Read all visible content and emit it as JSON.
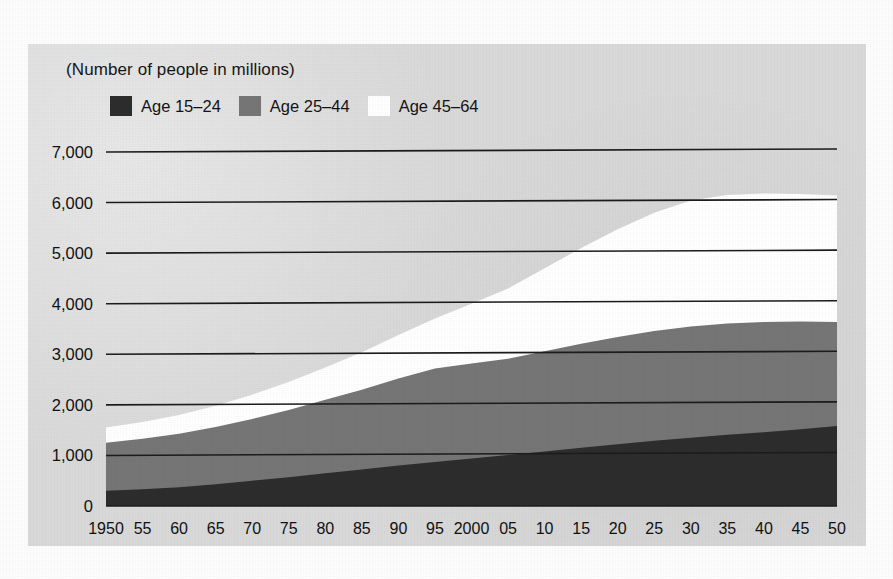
{
  "figure": {
    "units_label": "(Number of people in millions)"
  },
  "legend": {
    "items": [
      {
        "label": "Age 15–24",
        "color": "#2d2d2d"
      },
      {
        "label": "Age 25–44",
        "color": "#767676"
      },
      {
        "label": "Age 45–64",
        "color": "#ffffff"
      }
    ]
  },
  "colors": {
    "panel_background": "#d9d9d9",
    "age_15_24": "#2d2d2d",
    "age_25_44": "#767676",
    "age_45_64": "#ffffff",
    "axis": "#1c1c1c",
    "text": "#121212"
  },
  "chart_data": {
    "type": "area",
    "stacked": true,
    "title": "",
    "subtitle": "",
    "xlabel": "",
    "ylabel": "",
    "units": "(Number of people in millions)",
    "grid": true,
    "legend_position": "top-left",
    "xlim": [
      1950,
      2050
    ],
    "ylim": [
      0,
      7000
    ],
    "ytick_values": [
      0,
      1000,
      2000,
      3000,
      4000,
      5000,
      6000,
      7000
    ],
    "ytick_labels": [
      "0",
      "1,000",
      "2,000",
      "3,000",
      "4,000",
      "5,000",
      "6,000",
      "7,000"
    ],
    "x": [
      1950,
      1955,
      1960,
      1965,
      1970,
      1975,
      1980,
      1985,
      1990,
      1995,
      2000,
      2005,
      2010,
      2015,
      2020,
      2025,
      2030,
      2035,
      2040,
      2045,
      2050
    ],
    "xtick_labels": [
      "1950",
      "55",
      "60",
      "65",
      "70",
      "75",
      "80",
      "85",
      "90",
      "95",
      "2000",
      "05",
      "10",
      "15",
      "20",
      "25",
      "30",
      "35",
      "40",
      "45",
      "50"
    ],
    "series": [
      {
        "name": "Age 15–24",
        "color": "#2d2d2d",
        "values": [
          300,
          330,
          370,
          430,
          500,
          570,
          650,
          720,
          800,
          870,
          940,
          1010,
          1080,
          1150,
          1220,
          1290,
          1350,
          1410,
          1460,
          1520,
          1580
        ]
      },
      {
        "name": "Age 25–44",
        "color": "#767676",
        "values": [
          950,
          1000,
          1060,
          1130,
          1220,
          1330,
          1450,
          1580,
          1720,
          1850,
          1880,
          1900,
          1980,
          2060,
          2120,
          2170,
          2200,
          2200,
          2180,
          2130,
          2060
        ]
      },
      {
        "name": "Age 45–64",
        "color": "#ffffff",
        "values": [
          300,
          330,
          370,
          420,
          480,
          550,
          640,
          740,
          860,
          990,
          1180,
          1390,
          1640,
          1890,
          2130,
          2340,
          2490,
          2540,
          2540,
          2520,
          2500
        ]
      }
    ],
    "totals": [
      1550,
      1660,
      1800,
      1980,
      2200,
      2450,
      2740,
      3040,
      3380,
      3710,
      4000,
      4300,
      4700,
      5100,
      5470,
      5800,
      6040,
      6150,
      6180,
      6170,
      6140
    ]
  }
}
